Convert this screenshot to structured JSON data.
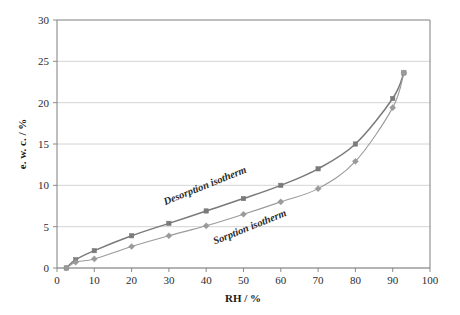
{
  "chart_data": {
    "type": "line",
    "title": "",
    "xlabel": "RH / %",
    "ylabel": "e. w. c. / %",
    "xlim": [
      0,
      100
    ],
    "ylim": [
      0,
      30
    ],
    "xticks": [
      0,
      10,
      20,
      30,
      40,
      50,
      60,
      70,
      80,
      90,
      100
    ],
    "yticks": [
      0,
      5,
      10,
      15,
      20,
      25,
      30
    ],
    "grid": "horizontal",
    "legend_position": "inline-annotations",
    "series": [
      {
        "name": "Desorption isotherm",
        "marker": "square",
        "color": "#7a7a7a",
        "x": [
          2.5,
          5,
          10,
          20,
          30,
          40,
          50,
          60,
          70,
          80,
          90,
          93
        ],
        "y": [
          0,
          1.0,
          2.1,
          3.9,
          5.4,
          6.9,
          8.4,
          10.0,
          12.0,
          15.0,
          20.5,
          23.6
        ]
      },
      {
        "name": "Sorption isotherm",
        "marker": "diamond",
        "color": "#9a9a9a",
        "x": [
          2.5,
          5,
          10,
          20,
          30,
          40,
          50,
          60,
          70,
          80,
          90,
          93
        ],
        "y": [
          0,
          0.7,
          1.1,
          2.6,
          3.9,
          5.1,
          6.5,
          8.0,
          9.6,
          12.9,
          19.4,
          23.6
        ]
      }
    ],
    "annotations": [
      {
        "text": "Desorption isotherm",
        "x": 40,
        "y": 9.6,
        "rotation": -22
      },
      {
        "text": "Sorption isotherm",
        "x": 52,
        "y": 4.6,
        "rotation": -22
      }
    ]
  },
  "axes": {
    "x_title": "RH / %",
    "y_title": "e. w. c. / %",
    "x_tick_labels": [
      "0",
      "10",
      "20",
      "30",
      "40",
      "50",
      "60",
      "70",
      "80",
      "90",
      "100"
    ],
    "y_tick_labels": [
      "0",
      "5",
      "10",
      "15",
      "20",
      "25",
      "30"
    ]
  },
  "annotations": {
    "desorption_label": "Desorption isotherm",
    "sorption_label": "Sorption isotherm"
  },
  "colors": {
    "desorption": "#7a7a7a",
    "sorption": "#9a9a9a",
    "grid": "#c9c9c9",
    "axis": "#7f7f7f",
    "text": "#2b2b2b",
    "background": "#ffffff"
  }
}
